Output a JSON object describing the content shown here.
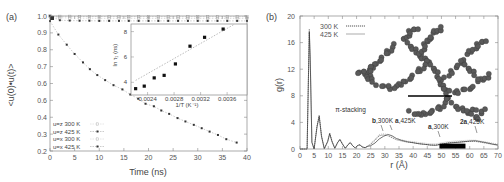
{
  "chart_data": [
    {
      "panel": "(a)",
      "type": "scatter",
      "xlabel": "Time (ns)",
      "ylabel": "<u(0)•u(t)>",
      "xlim": [
        0,
        40
      ],
      "ylim": [
        0.2,
        1.0
      ],
      "xticks": [
        0,
        5,
        10,
        15,
        20,
        25,
        30,
        35,
        40
      ],
      "yticks": [
        0.2,
        0.3,
        0.4,
        0.5,
        0.6,
        0.7,
        0.8,
        0.9,
        1.0
      ],
      "ytick_labels": [
        "0.2",
        "0.3",
        "0.4",
        "0.6",
        "0.6",
        "0.7",
        "0.8",
        "0.9",
        "1.0"
      ],
      "legend_position": "lower left",
      "series": [
        {
          "name": "u=z 300 K",
          "marker": "open",
          "x": [
            0,
            2,
            4,
            6,
            8,
            10,
            12,
            14,
            16,
            18,
            20,
            22,
            24,
            26,
            28,
            30,
            32,
            34,
            36,
            38,
            40
          ],
          "y": [
            1.0,
            0.998,
            0.998,
            0.997,
            0.997,
            0.997,
            0.996,
            0.996,
            0.996,
            0.996,
            0.996,
            0.995,
            0.995,
            0.995,
            0.995,
            0.995,
            0.995,
            0.995,
            0.995,
            0.995,
            0.995
          ]
        },
        {
          "name": "u=z 425 K",
          "marker": "filled",
          "x": [
            0,
            2,
            4,
            6,
            8,
            10,
            12,
            14,
            16,
            18,
            20,
            22,
            24,
            26,
            28,
            30,
            32,
            34,
            36,
            38,
            40
          ],
          "y": [
            1.0,
            0.975,
            0.973,
            0.972,
            0.972,
            0.971,
            0.971,
            0.971,
            0.971,
            0.971,
            0.971,
            0.971,
            0.971,
            0.971,
            0.971,
            0.971,
            0.971,
            0.971,
            0.971,
            0.971,
            0.971
          ]
        },
        {
          "name": "u=x 300 K",
          "marker": "open",
          "x": [
            0,
            2,
            4,
            6,
            8,
            10,
            12,
            14,
            16,
            18,
            20,
            22,
            24,
            26,
            28,
            30,
            32,
            34,
            36,
            38,
            40
          ],
          "y": [
            1.0,
            0.99,
            0.988,
            0.987,
            0.987,
            0.986,
            0.986,
            0.986,
            0.986,
            0.986,
            0.985,
            0.985,
            0.985,
            0.985,
            0.985,
            0.985,
            0.985,
            0.985,
            0.985,
            0.985,
            0.985
          ]
        },
        {
          "name": "u=x 425 K",
          "marker": "filled",
          "x": [
            0,
            1.7,
            3.4,
            5.0,
            6.7,
            8.1,
            9.6,
            11.2,
            12.9,
            14.7,
            16.3,
            17.9,
            19.4,
            21.1,
            22.6,
            24.2,
            25.9,
            27.5,
            29.2,
            30.8,
            32.4,
            34.1,
            35.8,
            37.9
          ],
          "y": [
            0.97,
            0.89,
            0.83,
            0.775,
            0.725,
            0.685,
            0.65,
            0.62,
            0.59,
            0.565,
            0.535,
            0.51,
            0.48,
            0.465,
            0.44,
            0.42,
            0.395,
            0.375,
            0.355,
            0.335,
            0.315,
            0.295,
            0.27,
            0.25
          ]
        }
      ],
      "inset": {
        "type": "scatter",
        "xlabel": "1/T (K⁻¹)",
        "ylabel": "ln τ₁ (ns)",
        "xticks": [
          "0.0024",
          "0.0028",
          "0.0032",
          "0.0036"
        ],
        "yticks": [
          "4",
          "6",
          "8"
        ],
        "xlim": [
          0.00215,
          0.0039
        ],
        "ylim": [
          3.0,
          8.6
        ],
        "points": {
          "x": [
            0.00222,
            0.00235,
            0.0025,
            0.00265,
            0.00282,
            0.00304,
            0.00326,
            0.00354
          ],
          "y": [
            3.5,
            3.7,
            4.35,
            4.55,
            5.45,
            6.85,
            7.55,
            8.2
          ]
        },
        "fit_line": {
          "x": [
            0.00222,
            0.0037
          ],
          "y": [
            4.15,
            8.55
          ],
          "style": "dashed"
        }
      }
    },
    {
      "panel": "(b)",
      "type": "line",
      "xlabel": "r (Å)",
      "ylabel": "g(r)",
      "xlim": [
        0,
        70
      ],
      "ylim": [
        0,
        20
      ],
      "xticks": [
        0,
        5,
        10,
        15,
        20,
        25,
        30,
        35,
        40,
        45,
        50,
        55,
        60,
        65,
        70
      ],
      "yticks": [
        0,
        4,
        8,
        12,
        16,
        20
      ],
      "legend_position": "upper left",
      "series": [
        {
          "name": "300 K",
          "style": "dashed",
          "x": [
            0,
            2.5,
            3.3,
            3.6,
            4.2,
            5.0,
            6.0,
            6.8,
            7.6,
            8.6,
            9.8,
            10.5,
            11.3,
            12.3,
            13.3,
            14.1,
            15.0,
            16.0,
            17.0,
            17.8,
            18.6,
            19.5,
            20.5,
            21.2,
            22.0,
            23.0,
            24.0,
            25.0,
            26.5,
            28.0,
            29.5,
            31.0,
            32.5,
            34.0,
            36.0,
            38.0,
            40.0,
            42.0,
            44.0,
            46.0,
            48.0,
            50.0,
            52.0,
            54.0,
            56.0,
            58.0,
            60.0,
            62.0,
            64.0,
            66.0,
            68.0,
            70.0
          ],
          "y": [
            0,
            0,
            18.0,
            14.0,
            1.0,
            0.0,
            3.5,
            5.1,
            2.0,
            0.05,
            1.2,
            2.4,
            1.2,
            0.1,
            1.0,
            1.5,
            0.8,
            0.1,
            0.7,
            1.0,
            0.5,
            0.15,
            0.6,
            0.65,
            0.35,
            0.2,
            0.5,
            0.7,
            1.3,
            2.0,
            2.1,
            2.0,
            1.7,
            1.4,
            1.2,
            1.0,
            0.95,
            0.8,
            0.7,
            0.6,
            0.6,
            0.75,
            0.9,
            1.0,
            1.05,
            1.1,
            1.15,
            1.15,
            1.0,
            0.85,
            0.7,
            0.55
          ]
        },
        {
          "name": "425 K",
          "style": "solid",
          "x": [
            0,
            2.5,
            3.3,
            3.6,
            4.2,
            5.0,
            6.0,
            6.8,
            7.6,
            8.6,
            9.8,
            10.5,
            11.3,
            12.3,
            13.3,
            14.1,
            15.0,
            16.0,
            17.0,
            17.8,
            18.6,
            19.5,
            20.5,
            21.2,
            22.0,
            23.0,
            24.0,
            25.0,
            26.5,
            28.0,
            29.5,
            31.0,
            32.5,
            34.0,
            36.0,
            38.0,
            40.0,
            42.0,
            44.0,
            46.0,
            48.0,
            50.0,
            52.0,
            54.0,
            56.0,
            58.0,
            60.0,
            62.0,
            64.0,
            66.0,
            68.0,
            70.0
          ],
          "y": [
            0,
            0,
            17.6,
            13.5,
            1.0,
            0.0,
            3.3,
            4.9,
            1.9,
            0.05,
            1.1,
            2.3,
            1.1,
            0.1,
            0.95,
            1.4,
            0.75,
            0.1,
            0.65,
            0.95,
            0.5,
            0.15,
            0.55,
            0.6,
            0.3,
            0.2,
            0.4,
            0.5,
            0.9,
            1.5,
            1.9,
            2.2,
            2.0,
            1.6,
            1.3,
            1.1,
            0.95,
            0.8,
            0.7,
            0.6,
            0.55,
            0.7,
            0.85,
            0.95,
            1.0,
            1.1,
            1.2,
            1.25,
            1.1,
            0.95,
            0.75,
            0.6
          ]
        }
      ],
      "annotations": [
        {
          "text": "π-stacking",
          "x": 12.5,
          "y": 5.8
        },
        {
          "text_bold": "b",
          "text": ",300K",
          "x": 26.5,
          "y": 5.5,
          "arrow_to": [
            28.5,
            2.3
          ]
        },
        {
          "text_bold": "a",
          "text": ",425K",
          "x": 32.0,
          "y": 5.5,
          "arrow_to": [
            31.0,
            2.4
          ]
        },
        {
          "text_bold": "a",
          "text": ",300K",
          "x": 44.5,
          "y": 4.6,
          "arrow_to": [
            49.0,
            0.9
          ]
        },
        {
          "text_bold": "2a",
          "text": ",425K",
          "x": 61.0,
          "y": 5.3,
          "arrow_to": [
            62.0,
            1.4
          ]
        }
      ],
      "scale_bar": {
        "x_start": 49.3,
        "x_end": 58.5,
        "y": 0.35,
        "color": "#000000"
      },
      "inset_image": "dendritic polymer molecule rendering with horizontal scale bar"
    }
  ],
  "labels": {
    "panel_a": "(a)",
    "panel_b": "(b)",
    "a_xlabel": "Time (ns)",
    "a_ylabel": "<u(0)•u(t)>",
    "b_xlabel": "r (Å)",
    "b_ylabel": "g(r)",
    "inset_xlabel": "1/T (K⁻¹)",
    "inset_ylabel": "ln τ₁ (ns)",
    "legend_a": [
      "u=z 300 K",
      "u=z 425 K",
      "u=x 300 K",
      "u=x 425 K"
    ],
    "legend_b": [
      "300 K",
      "425 K"
    ],
    "pi_stacking": "π-stacking",
    "ann_b300_bold": "b",
    "ann_b300": ",300K",
    "ann_a425_bold": "a",
    "ann_a425": ",425K",
    "ann_a300_bold": "a",
    "ann_a300": ",300K",
    "ann_2a425_bold": "2a",
    "ann_2a425": ",425K"
  },
  "colors": {
    "axis": "#888888",
    "text": "#555555",
    "series_dark": "#333333",
    "series_light": "#aaaaaa",
    "scale_bar": "#000000",
    "molecule": "#555555"
  }
}
